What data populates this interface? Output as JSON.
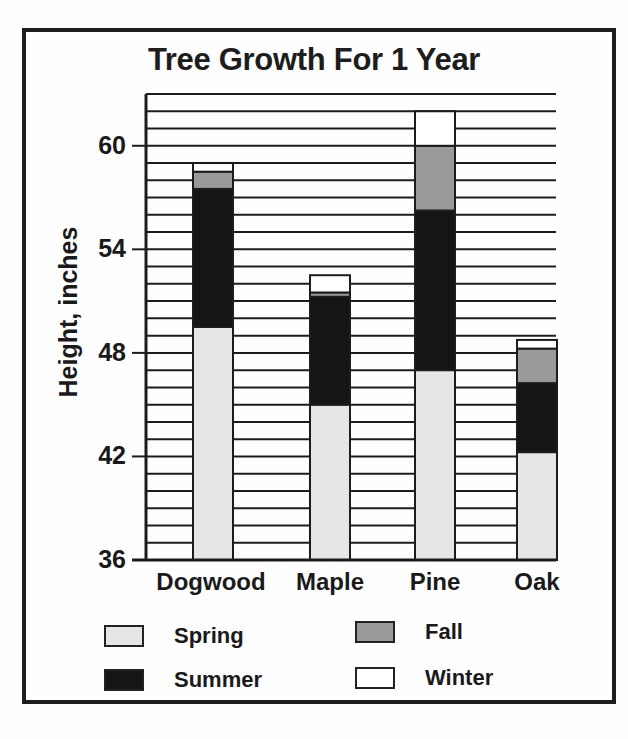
{
  "chart_data": {
    "type": "bar",
    "stacked": true,
    "title": "Tree Growth For 1 Year",
    "xlabel": "",
    "ylabel": "Height, inches",
    "ylim": [
      36,
      63
    ],
    "yticks": [
      36,
      42,
      48,
      54,
      60
    ],
    "grid": {
      "horizontal": true,
      "step": 1
    },
    "categories": [
      "Dogwood",
      "Maple",
      "Pine",
      "Oak"
    ],
    "base": 36,
    "series": [
      {
        "name": "Spring",
        "color": "#e6e6e6",
        "values": [
          13.5,
          9,
          11,
          6.25
        ],
        "tops": [
          49.5,
          45,
          47,
          42.25
        ]
      },
      {
        "name": "Summer",
        "color": "#151515",
        "values": [
          8,
          6.25,
          9.25,
          4
        ],
        "tops": [
          57.5,
          51.25,
          56.25,
          46.25
        ]
      },
      {
        "name": "Fall",
        "color": "#9a9a9a",
        "values": [
          1,
          0.25,
          3.75,
          2
        ],
        "tops": [
          58.5,
          51.5,
          60,
          48.25
        ]
      },
      {
        "name": "Winter",
        "color": "#ffffff",
        "values": [
          0.5,
          1,
          2,
          0.5
        ],
        "tops": [
          59,
          52.5,
          62,
          48.75
        ]
      }
    ],
    "totals": [
      59,
      52.5,
      62,
      48.75
    ],
    "legend_position": "bottom"
  },
  "legend": [
    {
      "label": "Spring",
      "color": "#e6e6e6"
    },
    {
      "label": "Summer",
      "color": "#151515"
    },
    {
      "label": "Fall",
      "color": "#9a9a9a"
    },
    {
      "label": "Winter",
      "color": "#ffffff"
    }
  ]
}
